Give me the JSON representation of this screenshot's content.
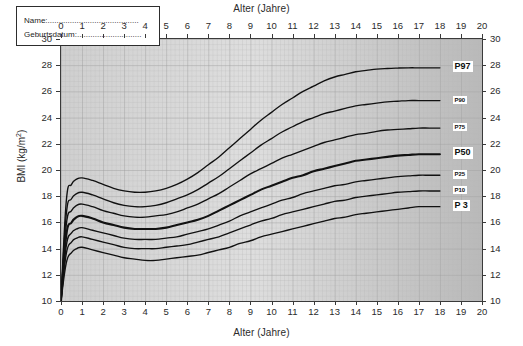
{
  "chart_data": {
    "type": "line",
    "title": "Alter (Jahre)",
    "title_bottom": "Alter (Jahre)",
    "xlabel": "Alter (Jahre)",
    "ylabel": "BMI (kg/m 2)",
    "ylabel_main": "BMI (kg/m",
    "ylabel_sup": "2",
    "ylabel_close": ")",
    "xlim": [
      0,
      20
    ],
    "ylim": [
      10,
      30
    ],
    "xticks": [
      0,
      1,
      2,
      3,
      4,
      5,
      6,
      7,
      8,
      9,
      10,
      11,
      12,
      13,
      14,
      15,
      16,
      17,
      18,
      19,
      20
    ],
    "yticks": [
      10,
      12,
      14,
      16,
      18,
      20,
      22,
      24,
      26,
      28,
      30
    ],
    "grid": true,
    "grid_minor_step_x": 0.2,
    "grid_minor_step_y": 0.4,
    "legend_position": "inside-top-left",
    "plot_bg": "#c9c9c9",
    "curve_color": "#111111",
    "axis_color": "#3a3a3a",
    "x": [
      0,
      0.25,
      0.5,
      0.75,
      1,
      1.5,
      2,
      2.5,
      3,
      3.5,
      4,
      4.5,
      5,
      5.5,
      6,
      6.5,
      7,
      7.5,
      8,
      8.5,
      9,
      9.5,
      10,
      10.5,
      11,
      11.5,
      12,
      12.5,
      13,
      13.5,
      14,
      14.5,
      15,
      15.5,
      16,
      16.5,
      17,
      17.5,
      18
    ],
    "series": [
      {
        "name": "P97",
        "label": "P97",
        "label_size": "big",
        "values": [
          10.0,
          17.6,
          18.9,
          19.3,
          19.4,
          19.2,
          18.9,
          18.6,
          18.4,
          18.3,
          18.3,
          18.4,
          18.6,
          18.9,
          19.3,
          19.8,
          20.4,
          21.0,
          21.7,
          22.4,
          23.1,
          23.8,
          24.4,
          25.0,
          25.5,
          26.0,
          26.4,
          26.8,
          27.1,
          27.3,
          27.5,
          27.6,
          27.7,
          27.75,
          27.78,
          27.8,
          27.8,
          27.8,
          27.8
        ]
      },
      {
        "name": "P90",
        "label": "P90",
        "label_size": "small",
        "values": [
          10.0,
          16.6,
          17.8,
          18.2,
          18.3,
          18.1,
          17.8,
          17.5,
          17.3,
          17.2,
          17.2,
          17.3,
          17.5,
          17.8,
          18.1,
          18.5,
          19.0,
          19.5,
          20.1,
          20.7,
          21.3,
          21.9,
          22.4,
          22.9,
          23.3,
          23.7,
          24.0,
          24.3,
          24.5,
          24.7,
          24.9,
          25.0,
          25.1,
          25.2,
          25.25,
          25.3,
          25.3,
          25.3,
          25.3
        ]
      },
      {
        "name": "P75",
        "label": "P75",
        "label_size": "small",
        "values": [
          10.0,
          15.8,
          16.9,
          17.3,
          17.4,
          17.2,
          16.9,
          16.7,
          16.5,
          16.4,
          16.4,
          16.5,
          16.6,
          16.8,
          17.1,
          17.4,
          17.8,
          18.2,
          18.7,
          19.2,
          19.7,
          20.1,
          20.5,
          20.9,
          21.2,
          21.5,
          21.8,
          22.1,
          22.3,
          22.5,
          22.7,
          22.8,
          22.95,
          23.05,
          23.1,
          23.15,
          23.2,
          23.2,
          23.2
        ]
      },
      {
        "name": "P50",
        "label": "P50",
        "label_size": "big",
        "bold": true,
        "values": [
          10.0,
          15.0,
          16.0,
          16.4,
          16.5,
          16.3,
          16.0,
          15.8,
          15.6,
          15.5,
          15.5,
          15.5,
          15.6,
          15.8,
          16.0,
          16.2,
          16.5,
          16.9,
          17.3,
          17.7,
          18.1,
          18.5,
          18.8,
          19.1,
          19.4,
          19.6,
          19.9,
          20.1,
          20.3,
          20.5,
          20.7,
          20.8,
          20.9,
          21.0,
          21.1,
          21.15,
          21.2,
          21.2,
          21.2
        ]
      },
      {
        "name": "P25",
        "label": "P25",
        "label_size": "small",
        "values": [
          10.0,
          14.2,
          15.2,
          15.5,
          15.6,
          15.4,
          15.2,
          15.0,
          14.8,
          14.7,
          14.7,
          14.7,
          14.8,
          14.9,
          15.1,
          15.3,
          15.5,
          15.8,
          16.1,
          16.5,
          16.8,
          17.1,
          17.4,
          17.7,
          17.9,
          18.2,
          18.4,
          18.6,
          18.8,
          18.9,
          19.1,
          19.2,
          19.3,
          19.4,
          19.5,
          19.55,
          19.6,
          19.6,
          19.6
        ]
      },
      {
        "name": "P10",
        "label": "P10",
        "label_size": "small",
        "values": [
          10.0,
          13.6,
          14.5,
          14.8,
          14.9,
          14.7,
          14.5,
          14.3,
          14.1,
          14.0,
          14.0,
          14.0,
          14.1,
          14.2,
          14.3,
          14.5,
          14.7,
          14.9,
          15.2,
          15.5,
          15.8,
          16.1,
          16.3,
          16.6,
          16.8,
          17.0,
          17.2,
          17.4,
          17.6,
          17.7,
          17.9,
          18.0,
          18.1,
          18.2,
          18.3,
          18.35,
          18.4,
          18.4,
          18.4
        ]
      },
      {
        "name": "P 3",
        "label": "P 3",
        "label_size": "big",
        "values": [
          10.0,
          12.9,
          13.7,
          14.0,
          14.1,
          13.9,
          13.7,
          13.5,
          13.3,
          13.2,
          13.1,
          13.1,
          13.2,
          13.3,
          13.4,
          13.5,
          13.7,
          13.9,
          14.1,
          14.4,
          14.6,
          14.9,
          15.1,
          15.3,
          15.5,
          15.7,
          15.9,
          16.1,
          16.3,
          16.4,
          16.6,
          16.7,
          16.8,
          16.9,
          17.0,
          17.1,
          17.2,
          17.2,
          17.2
        ]
      }
    ]
  },
  "legend": {
    "name_label": "Name:.........................................",
    "birthdate_label": "Geburtsdatum:............................."
  }
}
